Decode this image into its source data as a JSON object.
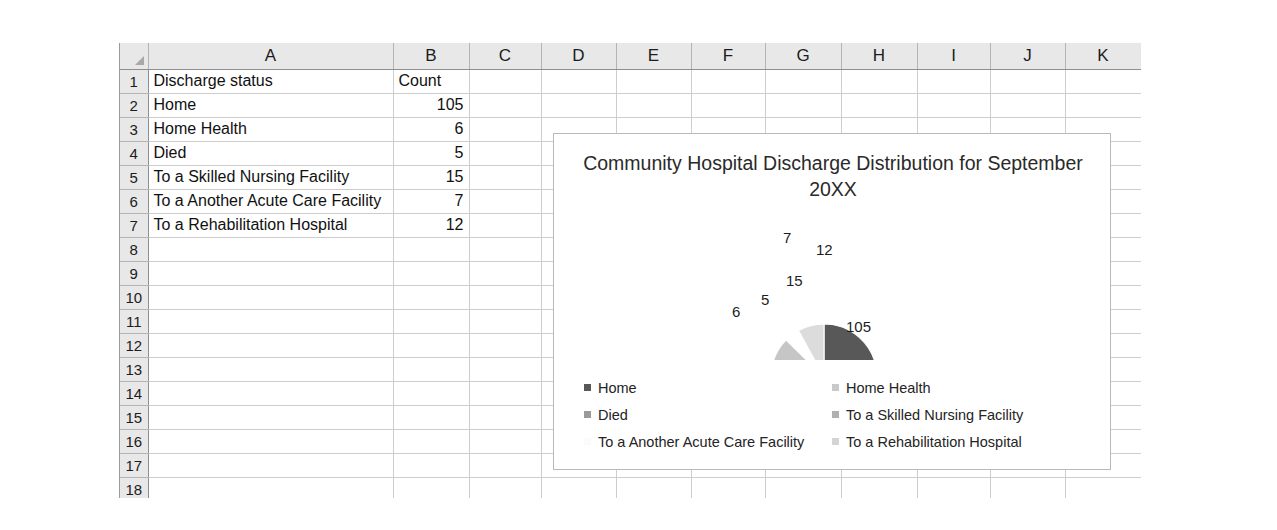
{
  "spreadsheet": {
    "column_headers": [
      "A",
      "B",
      "C",
      "D",
      "E",
      "F",
      "G",
      "H",
      "I",
      "J",
      "K"
    ],
    "row_numbers": [
      "1",
      "2",
      "3",
      "4",
      "5",
      "6",
      "7",
      "8",
      "9",
      "10",
      "11",
      "12",
      "13",
      "14",
      "15",
      "16",
      "17",
      "18"
    ],
    "corner_icon": "select-all-triangle-icon",
    "rows": [
      {
        "num": "1",
        "a": "Discharge status",
        "b": "Count",
        "b_align": "text"
      },
      {
        "num": "2",
        "a": "Home",
        "b": "105",
        "b_align": "number"
      },
      {
        "num": "3",
        "a": "Home Health",
        "b": "6",
        "b_align": "number"
      },
      {
        "num": "4",
        "a": "Died",
        "b": "5",
        "b_align": "number"
      },
      {
        "num": "5",
        "a": "To a Skilled Nursing Facility",
        "b": "15",
        "b_align": "number"
      },
      {
        "num": "6",
        "a": "To a Another Acute Care Facility",
        "b": "7",
        "b_align": "number"
      },
      {
        "num": "7",
        "a": "To a Rehabilitation Hospital",
        "b": "12",
        "b_align": "number"
      },
      {
        "num": "8",
        "a": "",
        "b": "",
        "b_align": "text"
      },
      {
        "num": "9",
        "a": "",
        "b": "",
        "b_align": "text"
      },
      {
        "num": "10",
        "a": "",
        "b": "",
        "b_align": "text"
      },
      {
        "num": "11",
        "a": "",
        "b": "",
        "b_align": "text"
      },
      {
        "num": "12",
        "a": "",
        "b": "",
        "b_align": "text"
      },
      {
        "num": "13",
        "a": "",
        "b": "",
        "b_align": "text"
      },
      {
        "num": "14",
        "a": "",
        "b": "",
        "b_align": "text"
      },
      {
        "num": "15",
        "a": "",
        "b": "",
        "b_align": "text"
      },
      {
        "num": "16",
        "a": "",
        "b": "",
        "b_align": "text"
      },
      {
        "num": "17",
        "a": "",
        "b": "",
        "b_align": "text"
      },
      {
        "num": "18",
        "a": "",
        "b": "",
        "b_align": "text"
      }
    ]
  },
  "chart_data": {
    "type": "pie",
    "title": "Community Hospital Discharge Distribution for September 20XX",
    "xlabel": "",
    "ylabel": "",
    "legend_position": "bottom",
    "grid": false,
    "categories": [
      "Home",
      "Home Health",
      "Died",
      "To a Skilled Nursing Facility",
      "To a Another Acute Care Facility",
      "To a Rehabilitation Hospital"
    ],
    "values": [
      105,
      6,
      5,
      15,
      7,
      12
    ],
    "total": 150,
    "data_labels": [
      "105",
      "6",
      "5",
      "15",
      "7",
      "12"
    ],
    "colors": [
      "#585858",
      "#f2f2f2",
      "#9a9a9a",
      "#c6c6c6",
      "#ffffff",
      "#dcdcdc"
    ],
    "legend_swatch_colors": [
      "#585858",
      "#c9c9c9",
      "#9a9a9a",
      "#b0b0b0",
      "#fbfbfb",
      "#d4d4d4"
    ],
    "slices": [
      {
        "label": "Home",
        "value": 105,
        "data_label": "105",
        "color": "#585858",
        "start_deg": 0,
        "end_deg": 252,
        "leader": false
      },
      {
        "label": "Home Health",
        "value": 6,
        "data_label": "6",
        "color": "#f2f2f2",
        "start_deg": 252,
        "end_deg": 266.4,
        "leader": true
      },
      {
        "label": "Died",
        "value": 5,
        "data_label": "5",
        "color": "#9a9a9a",
        "start_deg": 266.4,
        "end_deg": 278.4,
        "leader": false
      },
      {
        "label": "To a Skilled Nursing Facility",
        "value": 15,
        "data_label": "15",
        "color": "#c6c6c6",
        "start_deg": 278.4,
        "end_deg": 314.4,
        "leader": false
      },
      {
        "label": "To a Another Acute Care Facility",
        "value": 7,
        "data_label": "7",
        "color": "#ffffff",
        "start_deg": 314.4,
        "end_deg": 331.2,
        "leader": false
      },
      {
        "label": "To a Rehabilitation Hospital",
        "value": 12,
        "data_label": "12",
        "color": "#dcdcdc",
        "start_deg": 331.2,
        "end_deg": 360,
        "leader": false
      }
    ]
  },
  "legend": {
    "items": [
      {
        "label": "Home",
        "color": "#585858"
      },
      {
        "label": "Home Health",
        "color": "#c9c9c9"
      },
      {
        "label": "Died",
        "color": "#9a9a9a"
      },
      {
        "label": "To a Skilled Nursing Facility",
        "color": "#b0b0b0"
      },
      {
        "label": "To a Another Acute Care Facility",
        "color": "#fbfbfb"
      },
      {
        "label": "To a Rehabilitation Hospital",
        "color": "#d4d4d4"
      }
    ]
  },
  "pie_labels": [
    {
      "text": "7",
      "left": 783,
      "top": 229
    },
    {
      "text": "12",
      "left": 816,
      "top": 241
    },
    {
      "text": "15",
      "left": 786,
      "top": 272
    },
    {
      "text": "5",
      "left": 761,
      "top": 291
    },
    {
      "text": "6",
      "left": 732,
      "top": 303
    },
    {
      "text": "105",
      "left": 846,
      "top": 318
    }
  ]
}
